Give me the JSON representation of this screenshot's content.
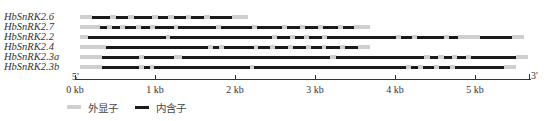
{
  "diagram": {
    "type": "gene-structure",
    "axis": {
      "start_label": "5'",
      "end_label": "3'",
      "ticks": [
        {
          "label": "0 kb",
          "kb": 0
        },
        {
          "label": "1 kb",
          "kb": 1
        },
        {
          "label": "2 kb",
          "kb": 2
        },
        {
          "label": "3 kb",
          "kb": 3
        },
        {
          "label": "4 kb",
          "kb": 4
        },
        {
          "label": "5 kb",
          "kb": 5
        }
      ],
      "origin_px": 75,
      "px_per_kb": 80,
      "max_kb": 5.7
    },
    "colors": {
      "exon": "#cfcfcf",
      "intron": "#1a1a1a"
    },
    "legend": [
      {
        "label": "外显子",
        "type": "exon"
      },
      {
        "label": "内含子",
        "type": "intron"
      }
    ],
    "genes": [
      {
        "name": "HbSnRK2.6",
        "segments": [
          [
            "exon",
            0.0,
            0.15
          ],
          [
            "intron",
            0.15,
            0.38
          ],
          [
            "exon",
            0.38,
            0.45
          ],
          [
            "intron",
            0.45,
            0.6
          ],
          [
            "exon",
            0.6,
            0.67
          ],
          [
            "intron",
            0.67,
            0.9
          ],
          [
            "exon",
            0.9,
            0.97
          ],
          [
            "intron",
            0.97,
            1.1
          ],
          [
            "exon",
            1.1,
            1.17
          ],
          [
            "intron",
            1.17,
            1.32
          ],
          [
            "exon",
            1.32,
            1.39
          ],
          [
            "intron",
            1.39,
            1.55
          ],
          [
            "exon",
            1.55,
            1.62
          ],
          [
            "intron",
            1.62,
            1.9
          ],
          [
            "exon",
            1.9,
            2.1
          ]
        ]
      },
      {
        "name": "HbSnRK2.7",
        "segments": [
          [
            "exon",
            0.0,
            0.25
          ],
          [
            "intron",
            0.25,
            0.34
          ],
          [
            "exon",
            0.34,
            0.4
          ],
          [
            "intron",
            0.4,
            0.5
          ],
          [
            "exon",
            0.5,
            0.56
          ],
          [
            "intron",
            0.56,
            0.7
          ],
          [
            "exon",
            0.7,
            0.76
          ],
          [
            "intron",
            0.76,
            0.88
          ],
          [
            "exon",
            0.88,
            0.94
          ],
          [
            "intron",
            0.94,
            1.17
          ],
          [
            "exon",
            1.17,
            1.23
          ],
          [
            "intron",
            1.23,
            1.7
          ],
          [
            "exon",
            1.7,
            1.76
          ],
          [
            "intron",
            1.76,
            2.15
          ],
          [
            "exon",
            2.15,
            2.21
          ],
          [
            "intron",
            2.21,
            2.53
          ],
          [
            "exon",
            2.53,
            2.59
          ],
          [
            "intron",
            2.59,
            2.75
          ],
          [
            "exon",
            2.75,
            2.81
          ],
          [
            "intron",
            2.81,
            2.98
          ],
          [
            "exon",
            2.98,
            3.04
          ],
          [
            "intron",
            3.04,
            3.23
          ],
          [
            "exon",
            3.23,
            3.29
          ],
          [
            "intron",
            3.29,
            3.42
          ],
          [
            "exon",
            3.42,
            3.62
          ]
        ]
      },
      {
        "name": "HbSnRK2.2",
        "segments": [
          [
            "exon",
            0.0,
            0.1
          ],
          [
            "intron",
            0.1,
            1.07
          ],
          [
            "exon",
            1.07,
            1.13
          ],
          [
            "intron",
            1.13,
            2.4
          ],
          [
            "exon",
            2.4,
            2.46
          ],
          [
            "intron",
            2.46,
            2.63
          ],
          [
            "exon",
            2.63,
            2.69
          ],
          [
            "intron",
            2.69,
            2.8
          ],
          [
            "exon",
            2.8,
            2.86
          ],
          [
            "intron",
            2.86,
            3.03
          ],
          [
            "exon",
            3.03,
            3.09
          ],
          [
            "intron",
            3.09,
            3.95
          ],
          [
            "exon",
            3.95,
            4.01
          ],
          [
            "intron",
            4.01,
            4.15
          ],
          [
            "exon",
            4.15,
            4.21
          ],
          [
            "intron",
            4.21,
            4.55
          ],
          [
            "exon",
            4.55,
            4.61
          ],
          [
            "intron",
            4.61,
            4.73
          ],
          [
            "exon",
            4.73,
            5.0
          ],
          [
            "intron",
            5.0,
            5.4
          ],
          [
            "exon",
            5.4,
            5.55
          ]
        ]
      },
      {
        "name": "HbSnRK2.4",
        "segments": [
          [
            "exon",
            0.0,
            0.32
          ],
          [
            "intron",
            0.32,
            1.6
          ],
          [
            "exon",
            1.6,
            1.66
          ],
          [
            "intron",
            1.66,
            1.74
          ],
          [
            "exon",
            1.74,
            1.8
          ],
          [
            "intron",
            1.8,
            2.17
          ],
          [
            "exon",
            2.17,
            2.23
          ],
          [
            "intron",
            2.23,
            2.38
          ],
          [
            "exon",
            2.38,
            2.44
          ],
          [
            "intron",
            2.44,
            2.6
          ],
          [
            "exon",
            2.6,
            2.66
          ],
          [
            "intron",
            2.66,
            2.83
          ],
          [
            "exon",
            2.83,
            2.89
          ],
          [
            "intron",
            2.89,
            3.02
          ],
          [
            "exon",
            3.02,
            3.08
          ],
          [
            "intron",
            3.08,
            3.25
          ],
          [
            "exon",
            3.25,
            3.31
          ],
          [
            "intron",
            3.31,
            3.48
          ],
          [
            "exon",
            3.48,
            3.62
          ]
        ]
      },
      {
        "name": "HbSnRK2.3a",
        "segments": [
          [
            "exon",
            0.0,
            0.28
          ],
          [
            "intron",
            0.28,
            0.74
          ],
          [
            "exon",
            0.74,
            0.8
          ],
          [
            "intron",
            0.8,
            1.17
          ],
          [
            "exon",
            1.17,
            1.28
          ],
          [
            "intron",
            1.28,
            3.13
          ],
          [
            "exon",
            3.13,
            3.2
          ],
          [
            "intron",
            3.2,
            4.3
          ],
          [
            "exon",
            4.3,
            4.38
          ],
          [
            "intron",
            4.38,
            4.48
          ],
          [
            "exon",
            4.48,
            4.55
          ],
          [
            "intron",
            4.55,
            4.65
          ],
          [
            "exon",
            4.65,
            4.71
          ],
          [
            "intron",
            4.71,
            4.83
          ],
          [
            "exon",
            4.83,
            4.89
          ],
          [
            "intron",
            4.89,
            5.45
          ],
          [
            "exon",
            5.45,
            5.6
          ]
        ]
      },
      {
        "name": "HbSnRK2.3b",
        "segments": [
          [
            "exon",
            0.0,
            0.28
          ],
          [
            "intron",
            0.28,
            0.74
          ],
          [
            "exon",
            0.74,
            0.8
          ],
          [
            "intron",
            0.8,
            0.87
          ],
          [
            "exon",
            0.87,
            0.92
          ],
          [
            "intron",
            0.92,
            2.12
          ],
          [
            "exon",
            2.12,
            2.18
          ],
          [
            "intron",
            2.18,
            4.08
          ],
          [
            "exon",
            4.08,
            4.14
          ],
          [
            "intron",
            4.14,
            4.23
          ],
          [
            "exon",
            4.23,
            4.29
          ],
          [
            "intron",
            4.29,
            4.43
          ],
          [
            "exon",
            4.43,
            4.49
          ],
          [
            "intron",
            4.49,
            4.63
          ],
          [
            "exon",
            4.63,
            4.69
          ],
          [
            "intron",
            4.69,
            5.3
          ],
          [
            "exon",
            5.3,
            5.45
          ]
        ]
      }
    ]
  }
}
